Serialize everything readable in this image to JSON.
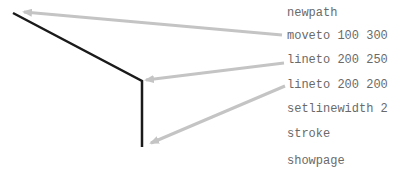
{
  "diagram": {
    "code_lines": [
      {
        "text": "newpath",
        "y": 6
      },
      {
        "text": "moveto 100 300",
        "y": 29
      },
      {
        "text": "lineto 200 250",
        "y": 53
      },
      {
        "text": "lineto 200 200",
        "y": 78
      },
      {
        "text": "setlinewidth 2",
        "y": 102
      },
      {
        "text": "stroke",
        "y": 127
      },
      {
        "text": "showpage",
        "y": 154
      }
    ],
    "path": {
      "points": [
        [
          13,
          13
        ],
        [
          142,
          81
        ],
        [
          142,
          147
        ]
      ],
      "color": "#1a1a1a",
      "width": 2.5
    },
    "arrows": [
      {
        "from": [
          282,
          35
        ],
        "to": [
          24,
          12
        ],
        "label_ref": "moveto 100 300"
      },
      {
        "from": [
          284,
          63
        ],
        "to": [
          146,
          80
        ],
        "label_ref": "lineto 200 250"
      },
      {
        "from": [
          285,
          86
        ],
        "to": [
          151,
          143
        ],
        "label_ref": "lineto 200 200"
      }
    ],
    "arrow_color": "#c4c4c4"
  }
}
